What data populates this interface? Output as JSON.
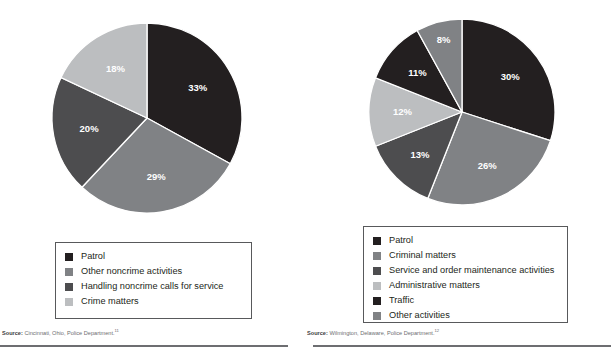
{
  "page": {
    "background": "#ffffff",
    "width": 611,
    "height": 353
  },
  "palette": {
    "black": "#231f20",
    "dark_gray": "#4d4d4f",
    "medium_gray": "#808285",
    "light_gray": "#bcbec0",
    "label_white": "#ffffff",
    "legend_border": "#58595b",
    "rule": "#6d6e71"
  },
  "panels": [
    {
      "id": "cincinnati",
      "source_prefix": "Source:",
      "source_text": "Cincinnati, Ohio, Police Department.",
      "source_superscript": "11",
      "legend": [
        {
          "label": "Patrol",
          "color": "#231f20"
        },
        {
          "label": "Other noncrime activities",
          "color": "#808285"
        },
        {
          "label": "Handling noncrime calls for service",
          "color": "#4d4d4f"
        },
        {
          "label": "Crime matters",
          "color": "#bcbec0"
        }
      ]
    },
    {
      "id": "wilmington",
      "source_prefix": "Source:",
      "source_text": "Wilmington, Delaware, Police Department.",
      "source_superscript": "12",
      "legend": [
        {
          "label": "Patrol",
          "color": "#231f20"
        },
        {
          "label": "Criminal matters",
          "color": "#808285"
        },
        {
          "label": "Service and order maintenance activities",
          "color": "#4d4d4f"
        },
        {
          "label": "Administrative matters",
          "color": "#bcbec0"
        },
        {
          "label": "Traffic",
          "color": "#231f20"
        },
        {
          "label": "Other activities",
          "color": "#808285"
        }
      ]
    }
  ],
  "chart_data": [
    {
      "type": "pie",
      "id": "cincinnati-pie",
      "title": "",
      "source": "Source: Cincinnati, Ohio, Police Department.",
      "start_angle_deg": 0,
      "direction": "clockwise",
      "legend_position": "below",
      "grid": false,
      "categories": [
        "Patrol",
        "Other noncrime activities",
        "Handling noncrime calls for service",
        "Crime matters"
      ],
      "values": [
        33,
        29,
        20,
        18
      ],
      "labels": [
        "33%",
        "29%",
        "20%",
        "18%"
      ],
      "colors": [
        "#231f20",
        "#808285",
        "#4d4d4f",
        "#bcbec0"
      ],
      "units": "percent"
    },
    {
      "type": "pie",
      "id": "wilmington-pie",
      "title": "",
      "source": "Source: Wilmington, Delaware, Police Department.",
      "start_angle_deg": 0,
      "direction": "clockwise",
      "legend_position": "below",
      "grid": false,
      "categories": [
        "Patrol",
        "Criminal matters",
        "Service and order maintenance activities",
        "Administrative matters",
        "Traffic",
        "Other activities"
      ],
      "values": [
        30,
        26,
        13,
        12,
        11,
        8
      ],
      "labels": [
        "30%",
        "26%",
        "13%",
        "12%",
        "11%",
        "8%"
      ],
      "colors": [
        "#231f20",
        "#808285",
        "#4d4d4f",
        "#bcbec0",
        "#231f20",
        "#808285"
      ],
      "units": "percent"
    }
  ]
}
